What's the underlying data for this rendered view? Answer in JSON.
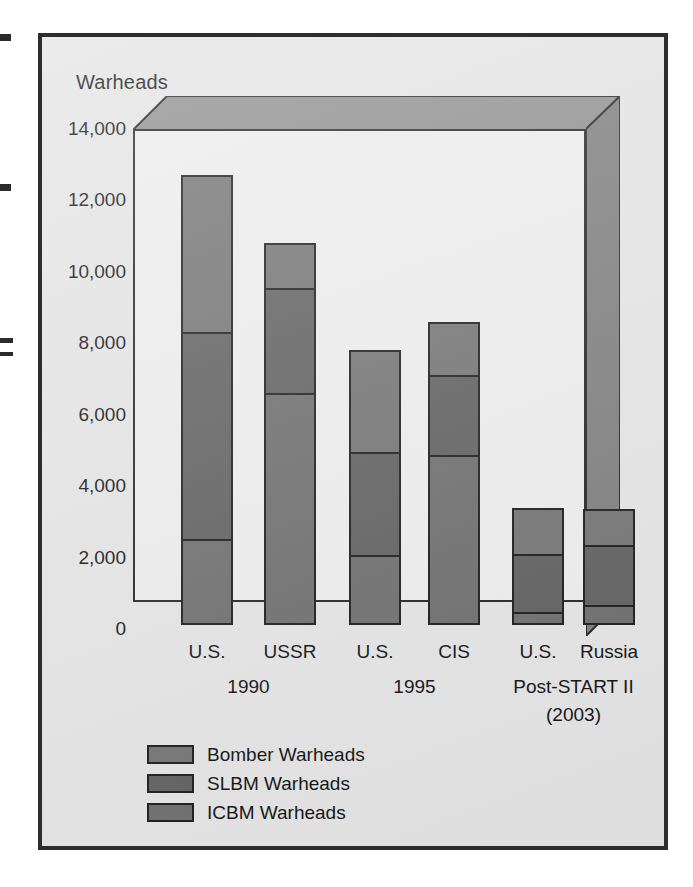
{
  "figure": {
    "axis_title": "Warheads",
    "background": "#e3e3e3",
    "plot_background": "#ececec",
    "frame_color": "#2d2d2d",
    "box_top_face_color": "#8c8c8c",
    "box_right_face_color": "#7b7b7b"
  },
  "chart_data": {
    "type": "bar",
    "subtype": "stacked-vertical-3d",
    "title": "",
    "xlabel": "",
    "ylabel": "Warheads",
    "ylim": [
      0,
      14000
    ],
    "yticks": [
      0,
      2000,
      4000,
      6000,
      8000,
      10000,
      12000,
      14000
    ],
    "ytick_labels": [
      "0",
      "2,000",
      "4,000",
      "6,000",
      "8,000",
      "10,000",
      "12,000",
      "14,000"
    ],
    "grid": false,
    "legend_position": "bottom-left",
    "categories": [
      "U.S.",
      "USSR",
      "U.S.",
      "CIS",
      "U.S.",
      "Russia"
    ],
    "groups": [
      {
        "label": "1990",
        "members": [
          "U.S.",
          "USSR"
        ]
      },
      {
        "label": "1995",
        "members": [
          "U.S.",
          "CIS"
        ]
      },
      {
        "label": "Post-START II",
        "sublabel": "(2003)",
        "members": [
          "U.S.",
          "Russia"
        ]
      }
    ],
    "series": [
      {
        "name": "ICBM Warheads",
        "color": "#6a6a6a",
        "values": [
          2400,
          6500,
          1950,
          4750,
          350,
          550
        ]
      },
      {
        "name": "SLBM Warheads",
        "color": "#5c5c5c",
        "values": [
          5850,
          3000,
          2950,
          2300,
          1700,
          1750
        ]
      },
      {
        "name": "Bomber Warheads",
        "color": "#707070",
        "values": [
          4450,
          1300,
          2900,
          1550,
          1350,
          1050
        ]
      }
    ],
    "totals": [
      12700,
      10800,
      7800,
      8600,
      3400,
      3350
    ],
    "stack_order_bottom_to_top": [
      "ICBM Warheads",
      "SLBM Warheads",
      "Bomber Warheads"
    ],
    "cumulative_boundaries": [
      [
        2400,
        8250,
        12700
      ],
      [
        6500,
        9500,
        10800
      ],
      [
        1950,
        4900,
        7800
      ],
      [
        4750,
        7050,
        8600
      ],
      [
        350,
        2050,
        3400
      ],
      [
        550,
        2300,
        3350
      ]
    ]
  },
  "legend": {
    "items": [
      {
        "label": "Bomber Warheads",
        "color": "#707070"
      },
      {
        "label": "SLBM Warheads",
        "color": "#5c5c5c"
      },
      {
        "label": "ICBM Warheads",
        "color": "#6a6a6a"
      }
    ]
  },
  "xaxis": {
    "bar_labels": [
      "U.S.",
      "USSR",
      "U.S.",
      "CIS",
      "U.S.",
      "Russia"
    ],
    "group_labels": [
      "1990",
      "1995",
      "Post-START II"
    ],
    "group_sublabel": "(2003)"
  }
}
